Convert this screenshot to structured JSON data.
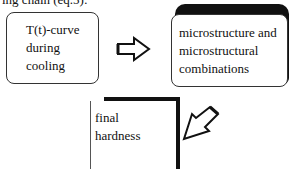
{
  "caption": "ing chain (eq.5):",
  "nodes": [
    {
      "id": "temperature-curve",
      "lines": [
        "T(t)-curve",
        "during",
        "cooling"
      ]
    },
    {
      "id": "microstructure",
      "lines": [
        "microstructure and",
        "microstructural",
        "combinations"
      ]
    },
    {
      "id": "final-hardness",
      "lines": [
        "final",
        "hardness"
      ]
    }
  ],
  "edges": [
    {
      "from": "temperature-curve",
      "to": "microstructure",
      "icon": "right-arrow-icon"
    },
    {
      "from": "microstructure",
      "to": "final-hardness",
      "icon": "down-left-arrow-icon"
    }
  ]
}
